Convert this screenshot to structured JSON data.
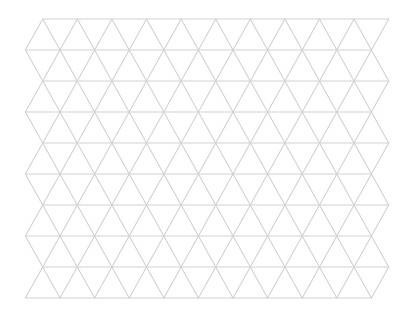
{
  "canvas": {
    "width": 413,
    "height": 320,
    "background": "#ffffff"
  },
  "grid": {
    "type": "triangular-lattice",
    "line_color": "#d2d2d2",
    "line_width": 1.1,
    "rows": 10,
    "vertices_per_row": 11,
    "origin_x_even_rows": 42.7,
    "origin_x_odd_rows": 25.4,
    "origin_y": 19,
    "dx": 34.6,
    "dy": 31
  }
}
